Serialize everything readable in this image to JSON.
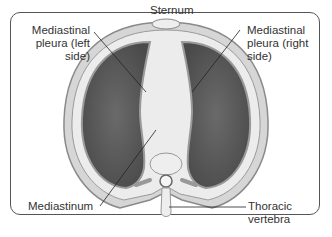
{
  "diagram": {
    "labels": {
      "sternum": "Sternum",
      "mediastinal_pleura_left_line1": "Mediastinal",
      "mediastinal_pleura_left_line2": "pleura (left",
      "mediastinal_pleura_left_line3": "side)",
      "mediastinal_pleura_right_line1": "Mediastinal",
      "mediastinal_pleura_right_line2": "pleura (right",
      "mediastinal_pleura_right_line3": "side)",
      "mediastinum": "Mediastinum",
      "thoracic_vertebra_line1": "Thoracic",
      "thoracic_vertebra_line2": "vertebra"
    },
    "colors": {
      "lung": "#5c5c5c",
      "pleura": "#c8c8c8",
      "mediastinum": "#e2e2e2",
      "bone": "#eeeeee",
      "outline": "#555555"
    }
  }
}
